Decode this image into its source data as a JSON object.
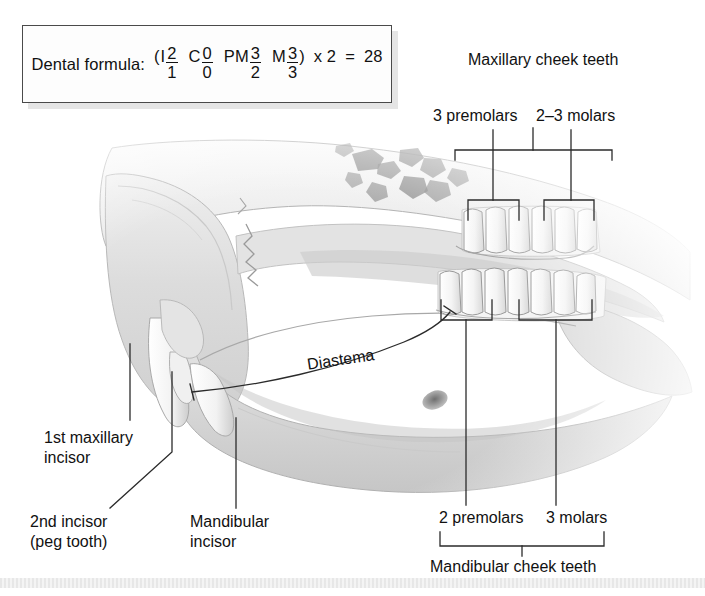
{
  "figure": {
    "domain": "anatomical-diagram",
    "background_color": "#ffffff",
    "ink_color": "#111111",
    "bone_gray": "#d8d8d8",
    "tooth_white": "#fbfbfb"
  },
  "formula": {
    "prefix": "Dental formula:",
    "open_paren": "(",
    "close_paren": ")",
    "groups": [
      {
        "symbol": "I",
        "upper": "2",
        "lower": "1"
      },
      {
        "symbol": "C",
        "upper": "0",
        "lower": "0"
      },
      {
        "symbol": "PM",
        "upper": "3",
        "lower": "2"
      },
      {
        "symbol": "M",
        "upper": "3",
        "lower": "3"
      }
    ],
    "multiplier": "x 2",
    "equals": "=",
    "total": "28"
  },
  "labels": {
    "maxillary_cheek_teeth": "Maxillary cheek teeth",
    "premolars_upper": "3 premolars",
    "molars_upper": "2–3 molars",
    "premolars_lower": "2 premolars",
    "molars_lower": "3 molars",
    "mandibular_cheek_teeth": "Mandibular cheek teeth",
    "first_maxillary_incisor_line1": "1st maxillary",
    "first_maxillary_incisor_line2": "incisor",
    "second_incisor_line1": "2nd incisor",
    "second_incisor_line2": "(peg tooth)",
    "mandibular_incisor_line1": "Mandibular",
    "mandibular_incisor_line2": "incisor",
    "diastema": "Diastema"
  }
}
